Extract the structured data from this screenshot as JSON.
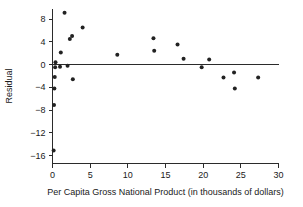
{
  "chart_data": {
    "type": "scatter",
    "title": "",
    "subtitle": "",
    "xlabel": "Per Capita Gross National Product (in thousands of dollars)",
    "ylabel": "Residual",
    "xlim": [
      0,
      30
    ],
    "ylim": [
      -17,
      10
    ],
    "xticks": [
      0,
      5,
      10,
      15,
      20,
      25,
      30
    ],
    "xtick_labels": [
      "0",
      "5",
      "10",
      "15",
      "20",
      "25",
      "30"
    ],
    "yticks": [
      8,
      4,
      0,
      -4,
      -8,
      -12,
      -16
    ],
    "ytick_labels": [
      "8",
      "4",
      "0",
      "−4",
      "−8",
      "−12",
      "−16"
    ],
    "grid": false,
    "legend": null,
    "reference_lines": [
      {
        "name": "zero-residual-line",
        "orientation": "horizontal",
        "y": 0
      }
    ],
    "marker": {
      "shape": "circle",
      "size": 2.0,
      "color": "#222222"
    },
    "points": [
      {
        "x": 0.15,
        "y": -15.1
      },
      {
        "x": 0.2,
        "y": -7.1
      },
      {
        "x": 0.25,
        "y": -4.2
      },
      {
        "x": 0.3,
        "y": -2.2
      },
      {
        "x": 0.35,
        "y": -0.5
      },
      {
        "x": 0.4,
        "y": 0.4
      },
      {
        "x": 1.0,
        "y": -0.4
      },
      {
        "x": 1.1,
        "y": 2.1
      },
      {
        "x": 1.6,
        "y": 9.1
      },
      {
        "x": 2.0,
        "y": -0.2
      },
      {
        "x": 2.3,
        "y": 4.5
      },
      {
        "x": 2.6,
        "y": 5.0
      },
      {
        "x": 2.7,
        "y": -2.6
      },
      {
        "x": 4.0,
        "y": 6.5
      },
      {
        "x": 8.6,
        "y": 1.7
      },
      {
        "x": 13.4,
        "y": 4.6
      },
      {
        "x": 13.5,
        "y": 2.4
      },
      {
        "x": 16.6,
        "y": 3.5
      },
      {
        "x": 17.4,
        "y": 1.0
      },
      {
        "x": 19.8,
        "y": -0.5
      },
      {
        "x": 20.8,
        "y": 0.9
      },
      {
        "x": 22.7,
        "y": -2.3
      },
      {
        "x": 24.1,
        "y": -1.4
      },
      {
        "x": 24.2,
        "y": -4.2
      },
      {
        "x": 27.3,
        "y": -2.3
      }
    ]
  },
  "colors": {
    "axis": "#2b2b2b",
    "text": "#1a1a1a",
    "marker": "#222222",
    "background": "#ffffff"
  }
}
